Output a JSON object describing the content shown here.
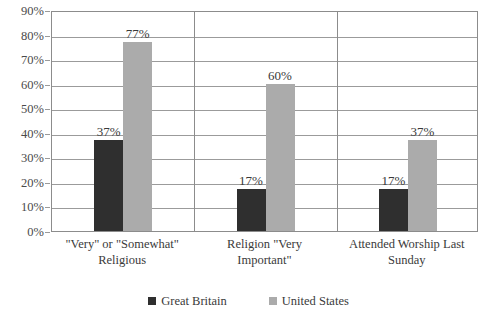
{
  "chart_data": {
    "type": "bar",
    "title": "",
    "xlabel": "",
    "ylabel": "",
    "ylim": [
      0,
      90
    ],
    "grid": true,
    "legend_position": "bottom",
    "categories": [
      "\"Very\" or \"Somewhat\" Religious",
      "Religion \"Very Important\"",
      "Attended Worship Last Sunday"
    ],
    "category_lines": [
      [
        "\"Very\" or \"Somewhat\"",
        "Religious"
      ],
      [
        "Religion \"Very",
        "Important\""
      ],
      [
        "Attended Worship Last",
        "Sunday"
      ]
    ],
    "series": [
      {
        "name": "Great Britain",
        "color": "#2f2f2f",
        "values": [
          37,
          17,
          17
        ],
        "labels": [
          "37%",
          "17%",
          "17%"
        ]
      },
      {
        "name": "United States",
        "color": "#ababab",
        "values": [
          77,
          60,
          37
        ],
        "labels": [
          "77%",
          "60%",
          "37%"
        ]
      }
    ],
    "y_ticks": [
      90,
      80,
      70,
      60,
      50,
      40,
      30,
      20,
      10,
      0
    ],
    "y_tick_labels": [
      "90%",
      "80%",
      "70%",
      "60%",
      "50%",
      "40%",
      "30%",
      "20%",
      "10%",
      "0%"
    ]
  },
  "legend": {
    "items": [
      {
        "label": "Great Britain",
        "color": "#2f2f2f"
      },
      {
        "label": "United States",
        "color": "#ababab"
      }
    ]
  },
  "colors": {
    "great_britain": "#2f2f2f",
    "united_states": "#ababab",
    "gridline": "#9b9b9b",
    "axis": "#8c8c8c",
    "text": "#3a3a3a"
  }
}
